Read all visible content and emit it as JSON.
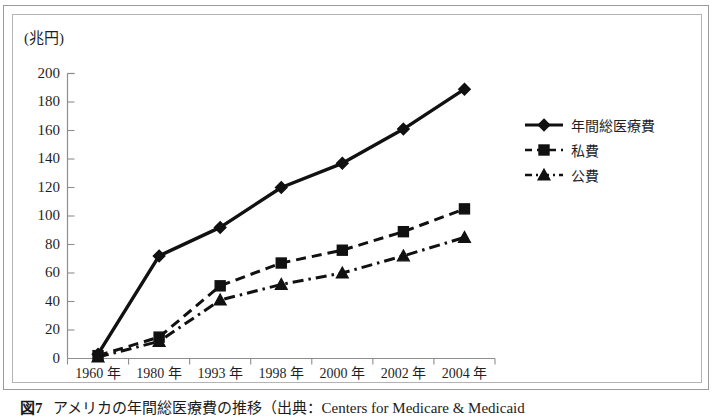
{
  "figure": {
    "unit_label": "(兆円)",
    "caption_number": "図7",
    "caption_text": "アメリカの年間総医療費の推移（出典：Centers for Medicare & Medicaid"
  },
  "legend": {
    "position": "right",
    "items": [
      {
        "label": "年間総医療費",
        "marker": "diamond",
        "style": "solid"
      },
      {
        "label": "私費",
        "marker": "square",
        "style": "dashed"
      },
      {
        "label": "公費",
        "marker": "triangle",
        "style": "dashdot"
      }
    ]
  },
  "chart_data": {
    "type": "line",
    "title": "",
    "subtitle": "",
    "xlabel": "",
    "ylabel": "(兆円)",
    "ylim": [
      0,
      200
    ],
    "ytick_step": 20,
    "yticks": [
      "0",
      "20",
      "40",
      "60",
      "80",
      "100",
      "120",
      "140",
      "160",
      "180",
      "200"
    ],
    "grid": false,
    "legend_position": "right",
    "categories": [
      "1960 年",
      "1980 年",
      "1993 年",
      "1998 年",
      "2000 年",
      "2002 年",
      "2004 年"
    ],
    "series": [
      {
        "name": "年間総医療費",
        "marker": "diamond",
        "style": "solid",
        "values": [
          3,
          72,
          92,
          120,
          137,
          161,
          189
        ]
      },
      {
        "name": "私費",
        "marker": "square",
        "style": "dashed",
        "values": [
          2,
          15,
          51,
          67,
          76,
          89,
          105
        ]
      },
      {
        "name": "公費",
        "marker": "triangle",
        "style": "dashdot",
        "values": [
          1,
          12,
          41,
          52,
          60,
          72,
          85
        ]
      }
    ],
    "colors": {
      "line": "#111111",
      "axis": "#8e8e8e",
      "background": "#ffffff"
    }
  }
}
